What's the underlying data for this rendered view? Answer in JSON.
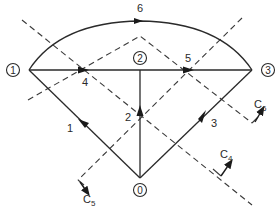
{
  "diagram": {
    "type": "network-flow-graph-with-cuts",
    "nodes": [
      {
        "id": "0",
        "label": "0"
      },
      {
        "id": "1",
        "label": "1"
      },
      {
        "id": "2",
        "label": "2"
      },
      {
        "id": "3",
        "label": "3"
      }
    ],
    "edges": [
      {
        "id": "1",
        "label": "1",
        "from": "0",
        "to": "1"
      },
      {
        "id": "2",
        "label": "2",
        "from": "0",
        "to": "2"
      },
      {
        "id": "3",
        "label": "3",
        "from": "0",
        "to": "3"
      },
      {
        "id": "4",
        "label": "4",
        "from": "1",
        "to": "2"
      },
      {
        "id": "5",
        "label": "5",
        "from": "2",
        "to": "3"
      },
      {
        "id": "6",
        "label": "6",
        "from": "1",
        "to": "3",
        "shape": "arc"
      }
    ],
    "cuts": [
      {
        "id": "C4",
        "label": "C",
        "subscript": "4"
      },
      {
        "id": "C5",
        "label": "C",
        "subscript": "5"
      },
      {
        "id": "C6",
        "label": "C",
        "subscript": "6"
      }
    ]
  }
}
